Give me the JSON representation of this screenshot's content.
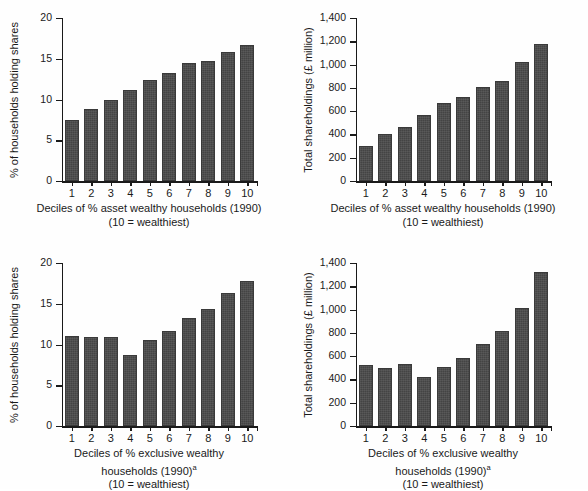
{
  "figure": {
    "background_color": "#fefefe",
    "bar_color": "#4b4b4b",
    "axis_color": "#1a1a1a",
    "panel_count": 4
  },
  "chart_data": [
    {
      "id": "top-left",
      "type": "bar",
      "title": "",
      "xlabel_lines": [
        "Deciles of % asset wealthy households (1990)",
        "(10 = wealthiest)"
      ],
      "xlabel_superscript": "",
      "ylabel": "% of households holding shares",
      "categories": [
        "1",
        "2",
        "3",
        "4",
        "5",
        "6",
        "7",
        "8",
        "9",
        "10"
      ],
      "values": [
        7.5,
        8.8,
        9.9,
        11.2,
        12.4,
        13.2,
        14.5,
        14.7,
        15.8,
        16.7
      ],
      "ylim": [
        0,
        20
      ],
      "yticks": [
        0,
        5,
        10,
        15,
        20
      ],
      "ytick_labels": [
        "0",
        "5",
        "10",
        "15",
        "20"
      ],
      "grid": false,
      "legend": "none"
    },
    {
      "id": "top-right",
      "type": "bar",
      "title": "",
      "xlabel_lines": [
        "Deciles of % asset wealthy households (1990)",
        "(10 = wealthiest)"
      ],
      "xlabel_superscript": "",
      "ylabel": "Total shareholdings (£ million)",
      "categories": [
        "1",
        "2",
        "3",
        "4",
        "5",
        "6",
        "7",
        "8",
        "9",
        "10"
      ],
      "values": [
        300,
        405,
        460,
        565,
        670,
        725,
        810,
        858,
        1020,
        1180
      ],
      "ylim": [
        0,
        1400
      ],
      "yticks": [
        0,
        200,
        400,
        600,
        800,
        1000,
        1200,
        1400
      ],
      "ytick_labels": [
        "0",
        "200",
        "400",
        "600",
        "800",
        "1,000",
        "1,200",
        "1,400"
      ],
      "grid": false,
      "legend": "none"
    },
    {
      "id": "bottom-left",
      "type": "bar",
      "title": "",
      "xlabel_lines": [
        "Deciles of % exclusive wealthy",
        "households (1990)",
        "(10 = wealthiest)"
      ],
      "xlabel_superscript": "a",
      "ylabel": "% of households holding shares",
      "categories": [
        "1",
        "2",
        "3",
        "4",
        "5",
        "6",
        "7",
        "8",
        "9",
        "10"
      ],
      "values": [
        11.0,
        10.9,
        10.9,
        8.7,
        10.5,
        11.6,
        13.3,
        14.4,
        16.3,
        17.8
      ],
      "ylim": [
        0,
        20
      ],
      "yticks": [
        0,
        5,
        10,
        15,
        20
      ],
      "ytick_labels": [
        "0",
        "5",
        "10",
        "15",
        "20"
      ],
      "grid": false,
      "legend": "none"
    },
    {
      "id": "bottom-right",
      "type": "bar",
      "title": "",
      "xlabel_lines": [
        "Deciles of % exclusive wealthy",
        "households (1990)",
        "(10 = wealthiest)"
      ],
      "xlabel_superscript": "a",
      "ylabel": "Total shareholdings (£ million)",
      "categories": [
        "1",
        "2",
        "3",
        "4",
        "5",
        "6",
        "7",
        "8",
        "9",
        "10"
      ],
      "values": [
        525,
        500,
        530,
        420,
        505,
        585,
        705,
        820,
        1010,
        1320
      ],
      "ylim": [
        0,
        1400
      ],
      "yticks": [
        0,
        200,
        400,
        600,
        800,
        1000,
        1200,
        1400
      ],
      "ytick_labels": [
        "0",
        "200",
        "400",
        "600",
        "800",
        "1,000",
        "1,200",
        "1,400"
      ],
      "grid": false,
      "legend": "none"
    }
  ]
}
